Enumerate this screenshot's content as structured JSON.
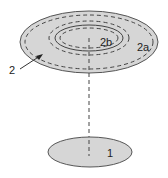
{
  "diagram": {
    "labels": {
      "outer_region": "2",
      "ring_region": "2a",
      "inner_region": "2b",
      "lower_body": "1"
    },
    "colors": {
      "fill": "#d6d6d6",
      "stroke": "#555555",
      "dash": "#444444",
      "background": "#ffffff"
    }
  }
}
